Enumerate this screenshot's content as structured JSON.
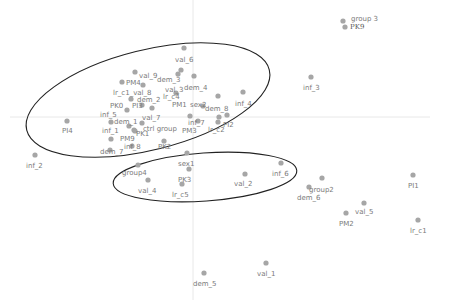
{
  "chart_data": {
    "type": "scatter",
    "title": "",
    "xlabel": "",
    "ylabel": "",
    "grid": false,
    "legend": null,
    "axes_origin_px": {
      "x": 193,
      "y": 117
    },
    "points": [
      {
        "label": "group 3",
        "x": 343,
        "y": 21,
        "lx": 351,
        "ly": 21
      },
      {
        "label": "PK9",
        "x": 345,
        "y": 27,
        "lx": 350,
        "ly": 29,
        "style": "dark"
      },
      {
        "label": "val_6",
        "x": 184,
        "y": 48,
        "lx": 175,
        "ly": 62
      },
      {
        "label": "inf_3",
        "x": 311,
        "y": 77,
        "lx": 303,
        "ly": 90
      },
      {
        "label": "val_9",
        "x": 135,
        "y": 72,
        "lx": 139,
        "ly": 78
      },
      {
        "label": "PM4",
        "x": 122,
        "y": 82,
        "lx": 126,
        "ly": 85
      },
      {
        "label": "dem_3",
        "x": 181,
        "y": 70,
        "lx": 157,
        "ly": 82
      },
      {
        "label": "dem_4",
        "x": 194,
        "y": 76,
        "lx": 184,
        "ly": 90
      },
      {
        "label": "val_3",
        "x": 178,
        "y": 74,
        "lx": 165,
        "ly": 92
      },
      {
        "label": "lr_c1_val_8",
        "x": 143,
        "y": 85,
        "lx": 113,
        "ly": 95
      },
      {
        "label": "dem_2",
        "x": 131,
        "y": 99,
        "lx": 137,
        "ly": 102
      },
      {
        "label": "lr_c4",
        "x": 176,
        "y": 93,
        "lx": 163,
        "ly": 99
      },
      {
        "label": "PM1",
        "x": 218,
        "y": 96,
        "lx": 172,
        "ly": 107
      },
      {
        "label": "sex2",
        "x": 203,
        "y": 106,
        "lx": 190,
        "ly": 107
      },
      {
        "label": "dem_8",
        "x": 219,
        "y": 117,
        "lx": 205,
        "ly": 111
      },
      {
        "label": "inf_4",
        "x": 243,
        "y": 92,
        "lx": 235,
        "ly": 106
      },
      {
        "label": "PK0",
        "x": 127,
        "y": 110,
        "lx": 110,
        "ly": 108
      },
      {
        "label": "PI3",
        "x": 152,
        "y": 108,
        "lx": 132,
        "ly": 108
      },
      {
        "label": "inf_5",
        "x": 142,
        "y": 105,
        "lx": 100,
        "ly": 117
      },
      {
        "label": "dem_1",
        "x": 111,
        "y": 122,
        "lx": 114,
        "ly": 124
      },
      {
        "label": "val_7",
        "x": 142,
        "y": 123,
        "lx": 142,
        "ly": 120
      },
      {
        "label": "inf_7",
        "x": 190,
        "y": 116,
        "lx": 188,
        "ly": 125
      },
      {
        "label": "PI2",
        "x": 227,
        "y": 115,
        "lx": 223,
        "ly": 127
      },
      {
        "label": "lr_c2",
        "x": 218,
        "y": 122,
        "lx": 208,
        "ly": 132
      },
      {
        "label": "PI4",
        "x": 67,
        "y": 121,
        "lx": 62,
        "ly": 133
      },
      {
        "label": "ctrl group",
        "x": 129,
        "y": 126,
        "lx": 143,
        "ly": 131
      },
      {
        "label": "PM3",
        "x": 198,
        "y": 121,
        "lx": 182,
        "ly": 133
      },
      {
        "label": "inf_1",
        "x": 134,
        "y": 130,
        "lx": 102,
        "ly": 133
      },
      {
        "label": "PK1",
        "x": 135,
        "y": 131,
        "lx": 136,
        "ly": 136
      },
      {
        "label": "PM9",
        "x": 111,
        "y": 139,
        "lx": 120,
        "ly": 141
      },
      {
        "label": "inf_8",
        "x": 132,
        "y": 146,
        "lx": 124,
        "ly": 149
      },
      {
        "label": "PK2",
        "x": 164,
        "y": 141,
        "lx": 158,
        "ly": 149
      },
      {
        "label": "dem_7",
        "x": 110,
        "y": 150,
        "lx": 100,
        "ly": 154
      },
      {
        "label": "inf_2",
        "x": 35,
        "y": 155,
        "lx": 26,
        "ly": 168
      },
      {
        "label": "sex1",
        "x": 187,
        "y": 153,
        "lx": 178,
        "ly": 166
      },
      {
        "label": "group4",
        "x": 138,
        "y": 165,
        "lx": 122,
        "ly": 175
      },
      {
        "label": "PK3",
        "x": 189,
        "y": 169,
        "lx": 178,
        "ly": 182
      },
      {
        "label": "val_4",
        "x": 148,
        "y": 180,
        "lx": 138,
        "ly": 193
      },
      {
        "label": "lr_c5",
        "x": 182,
        "y": 184,
        "lx": 172,
        "ly": 197
      },
      {
        "label": "val_2",
        "x": 245,
        "y": 174,
        "lx": 234,
        "ly": 186
      },
      {
        "label": "inf_6",
        "x": 281,
        "y": 163,
        "lx": 272,
        "ly": 176
      },
      {
        "label": "group2",
        "x": 322,
        "y": 178,
        "lx": 309,
        "ly": 192
      },
      {
        "label": "dem_6",
        "x": 309,
        "y": 187,
        "lx": 297,
        "ly": 200
      },
      {
        "label": "PI1",
        "x": 413,
        "y": 175,
        "lx": 408,
        "ly": 188
      },
      {
        "label": "val_5",
        "x": 364,
        "y": 203,
        "lx": 355,
        "ly": 214
      },
      {
        "label": "PM2",
        "x": 346,
        "y": 213,
        "lx": 339,
        "ly": 226
      },
      {
        "label": "lr_c1",
        "x": 418,
        "y": 220,
        "lx": 410,
        "ly": 233
      },
      {
        "label": "val_1",
        "x": 266,
        "y": 263,
        "lx": 257,
        "ly": 276
      },
      {
        "label": "dem_5",
        "x": 204,
        "y": 273,
        "lx": 193,
        "ly": 286
      }
    ],
    "ellipses": [
      {
        "name": "upper-group",
        "cx": 148,
        "cy": 100,
        "rx": 125,
        "ry": 50,
        "angle": -14
      },
      {
        "name": "lower-group",
        "cx": 205,
        "cy": 177,
        "rx": 92,
        "ry": 24,
        "angle": -4
      }
    ]
  }
}
